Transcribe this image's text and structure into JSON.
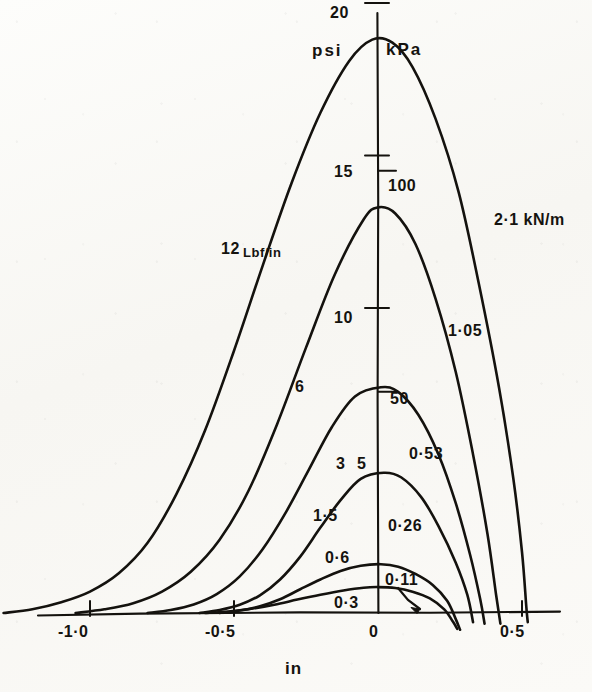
{
  "figure": {
    "xlabel": "in",
    "y_axis_left_unit": "psi",
    "y_axis_right_unit": "kPa"
  },
  "axes": {
    "x_ticks": [
      {
        "label": "-1·0",
        "value": -1.0
      },
      {
        "label": "-0·5",
        "value": -0.5
      },
      {
        "label": "0",
        "value": 0
      },
      {
        "label": "0·5",
        "value": 0.5
      }
    ],
    "y_ticks_psi": [
      {
        "label": "20",
        "value": 20
      },
      {
        "label": "15",
        "value": 15
      },
      {
        "label": "10",
        "value": 10
      }
    ],
    "y_ticks_kpa": [
      {
        "label": "100",
        "value": 100
      },
      {
        "label": "50",
        "value": 50
      }
    ]
  },
  "curve_labels": {
    "c12": "12",
    "c12_unit": "Lbf/in",
    "c12_metric": "2·1 kN/m",
    "c6": "6",
    "c6_metric": "1·05",
    "c3": "3",
    "c5": "5",
    "c3_metric": "0·53",
    "c15": "1·5",
    "c15_metric": "0·26",
    "c06": "0·6",
    "c06_metric": "0·11",
    "c03": "0·3"
  },
  "chart_data": {
    "type": "line",
    "title": "",
    "xlabel": "in",
    "ylabel": "psi",
    "y2label": "kPa",
    "xlim": [
      -1.35,
      0.62
    ],
    "ylim": [
      -0.6,
      20.2
    ],
    "y2lim": [
      -4.1,
      139.3
    ],
    "grid": false,
    "legend": "inline-curve-labels",
    "axis_notes": "psi on left of vertical axis, kPa on right; 20 psi ≈ 137.9 kPa",
    "series": [
      {
        "name": "12 Lbf/in",
        "metric_name": "2·1 kN/m",
        "label_imperial": "12 Lbf/in",
        "label_metric": "2·1 kN/m",
        "peak_x": -0.02,
        "peak_y_psi": 18.8,
        "peak_y_kpa": 129.6,
        "points": [
          [
            -1.3,
            0.0
          ],
          [
            -1.2,
            0.12
          ],
          [
            -1.1,
            0.35
          ],
          [
            -1.0,
            0.7
          ],
          [
            -0.9,
            1.3
          ],
          [
            -0.8,
            2.3
          ],
          [
            -0.7,
            3.9
          ],
          [
            -0.6,
            6.0
          ],
          [
            -0.5,
            8.6
          ],
          [
            -0.4,
            11.4
          ],
          [
            -0.3,
            14.1
          ],
          [
            -0.2,
            16.4
          ],
          [
            -0.1,
            18.1
          ],
          [
            -0.02,
            18.8
          ],
          [
            0.05,
            18.7
          ],
          [
            0.12,
            17.9
          ],
          [
            0.2,
            16.2
          ],
          [
            0.28,
            13.8
          ],
          [
            0.35,
            10.8
          ],
          [
            0.42,
            7.4
          ],
          [
            0.47,
            4.4
          ],
          [
            0.5,
            2.0
          ],
          [
            0.515,
            0.2
          ],
          [
            0.52,
            -0.3
          ]
        ]
      },
      {
        "name": "6 Lbf/in",
        "metric_name": "1·05 kN/m",
        "label_imperial": "6",
        "label_metric": "1·05",
        "peak_x": 0.0,
        "peak_y_psi": 13.3,
        "peak_y_kpa": 91.7,
        "points": [
          [
            -1.05,
            0.0
          ],
          [
            -0.95,
            0.12
          ],
          [
            -0.85,
            0.32
          ],
          [
            -0.75,
            0.7
          ],
          [
            -0.65,
            1.35
          ],
          [
            -0.55,
            2.4
          ],
          [
            -0.45,
            4.0
          ],
          [
            -0.35,
            6.2
          ],
          [
            -0.25,
            8.7
          ],
          [
            -0.15,
            11.1
          ],
          [
            -0.05,
            12.9
          ],
          [
            0.0,
            13.3
          ],
          [
            0.06,
            13.1
          ],
          [
            0.13,
            12.1
          ],
          [
            0.2,
            10.3
          ],
          [
            0.27,
            7.9
          ],
          [
            0.33,
            5.2
          ],
          [
            0.38,
            2.6
          ],
          [
            0.41,
            0.6
          ],
          [
            0.425,
            -0.35
          ]
        ]
      },
      {
        "name": "3 Lbf/in",
        "metric_name": "0·53 kN/m",
        "label_imperial": "3",
        "label_metric": "0·53",
        "peak_x": 0.01,
        "peak_y_psi": 7.4,
        "peak_y_kpa": 51.0,
        "points": [
          [
            -0.8,
            0.0
          ],
          [
            -0.72,
            0.1
          ],
          [
            -0.64,
            0.28
          ],
          [
            -0.56,
            0.62
          ],
          [
            -0.48,
            1.2
          ],
          [
            -0.4,
            2.1
          ],
          [
            -0.32,
            3.3
          ],
          [
            -0.24,
            4.7
          ],
          [
            -0.16,
            6.1
          ],
          [
            -0.08,
            7.1
          ],
          [
            0.01,
            7.4
          ],
          [
            0.07,
            7.25
          ],
          [
            0.14,
            6.5
          ],
          [
            0.21,
            5.2
          ],
          [
            0.27,
            3.6
          ],
          [
            0.32,
            1.9
          ],
          [
            0.355,
            0.45
          ],
          [
            0.37,
            -0.35
          ]
        ]
      },
      {
        "name": "1·5 Lbf/in",
        "metric_name": "0·26 kN/m",
        "label_imperial": "1·5",
        "label_metric": "0·26",
        "peak_x": 0.02,
        "peak_y_psi": 4.6,
        "peak_y_kpa": 31.7,
        "points": [
          [
            -0.62,
            0.0
          ],
          [
            -0.55,
            0.1
          ],
          [
            -0.48,
            0.27
          ],
          [
            -0.41,
            0.58
          ],
          [
            -0.34,
            1.1
          ],
          [
            -0.27,
            1.85
          ],
          [
            -0.2,
            2.8
          ],
          [
            -0.13,
            3.7
          ],
          [
            -0.06,
            4.4
          ],
          [
            0.02,
            4.6
          ],
          [
            0.08,
            4.45
          ],
          [
            0.15,
            3.8
          ],
          [
            0.21,
            2.85
          ],
          [
            0.27,
            1.65
          ],
          [
            0.31,
            0.6
          ],
          [
            0.33,
            -0.3
          ]
        ]
      },
      {
        "name": "0·6 Lbf/in",
        "metric_name": "0·11 kN/m",
        "label_imperial": "0·6",
        "label_metric": "0·11",
        "peak_x": 0.01,
        "peak_y_psi": 1.6,
        "peak_y_kpa": 11.0,
        "points": [
          [
            -0.55,
            0.0
          ],
          [
            -0.48,
            0.08
          ],
          [
            -0.41,
            0.22
          ],
          [
            -0.34,
            0.45
          ],
          [
            -0.27,
            0.78
          ],
          [
            -0.2,
            1.1
          ],
          [
            -0.13,
            1.38
          ],
          [
            -0.06,
            1.55
          ],
          [
            0.01,
            1.6
          ],
          [
            0.07,
            1.52
          ],
          [
            0.13,
            1.28
          ],
          [
            0.19,
            0.92
          ],
          [
            0.24,
            0.4
          ],
          [
            0.27,
            -0.2
          ],
          [
            0.285,
            -0.55
          ]
        ]
      },
      {
        "name": "0·3 Lbf/in",
        "metric_name": "",
        "label_imperial": "0·3",
        "label_metric": "",
        "peak_x": 0.0,
        "peak_y_psi": 0.85,
        "peak_y_kpa": 5.9,
        "points": [
          [
            -0.6,
            0.0
          ],
          [
            -0.52,
            0.05
          ],
          [
            -0.44,
            0.14
          ],
          [
            -0.36,
            0.27
          ],
          [
            -0.28,
            0.44
          ],
          [
            -0.2,
            0.6
          ],
          [
            -0.12,
            0.74
          ],
          [
            -0.05,
            0.83
          ],
          [
            0.0,
            0.85
          ],
          [
            0.06,
            0.82
          ],
          [
            0.12,
            0.7
          ],
          [
            0.18,
            0.48
          ],
          [
            0.23,
            0.12
          ],
          [
            0.26,
            -0.28
          ],
          [
            0.275,
            -0.52
          ]
        ]
      }
    ]
  }
}
